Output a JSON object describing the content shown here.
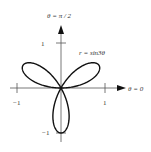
{
  "diagram": {
    "curve_label": "r = sin3θ",
    "axes": {
      "polar_axis_label": "θ = 0",
      "vertical_axis_label": "θ = π / 2",
      "x_tick_labels": [
        "−1",
        "1"
      ],
      "y_tick_labels": [
        "1",
        "−1"
      ]
    },
    "colors": {
      "background": "#ffffff",
      "curve": "#111111",
      "axis": "#555555",
      "text": "#333333"
    }
  },
  "chart_data": {
    "type": "line",
    "coordinate_system": "polar",
    "title": "",
    "equation": "r = sin(3θ)",
    "annotation": "r = sin3θ",
    "xlabel": "θ = 0",
    "ylabel": "θ = π / 2",
    "xlim": [
      -1,
      1
    ],
    "ylim": [
      -1,
      1
    ],
    "x_ticks": [
      -1,
      1
    ],
    "y_ticks": [
      -1,
      1
    ],
    "petals": 3,
    "petal_tip_angles_deg": [
      30,
      150,
      270
    ],
    "petal_length": 1,
    "grid": false,
    "legend": "none"
  }
}
